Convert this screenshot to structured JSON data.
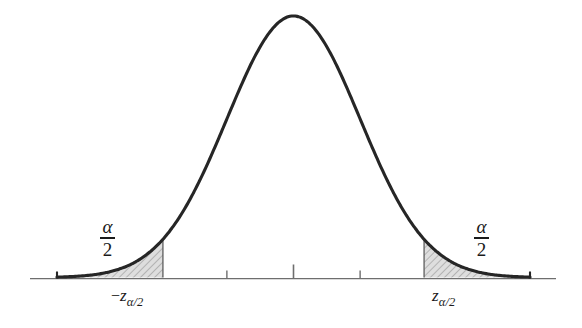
{
  "figure": {
    "background_color": "#ffffff",
    "curve_color": "#262626",
    "axis_color": "#6e6e6e",
    "shade_fill_color": "#d4d4d4",
    "shade_hatch_color": "#8c8c8c"
  },
  "labels": {
    "alpha_symbol": "α",
    "denominator": "2",
    "left_tail_area": "α/2",
    "right_tail_area": "α/2",
    "minus_sign": "−",
    "z_symbol": "z",
    "z_subscript": "α/2",
    "left_critical_value": "−zα/2",
    "right_critical_value": "zα/2"
  },
  "chart_data": {
    "type": "line",
    "title": "",
    "subtitle": "",
    "xlabel": "",
    "ylabel": "",
    "grid": false,
    "legend": null,
    "distribution": "standard normal (Gaussian)",
    "mean": 0,
    "sigma": 1,
    "xlim": [
      -3.55,
      3.55
    ],
    "ylim": [
      0,
      0.42
    ],
    "axis_tick_positions": [
      -1,
      0,
      1
    ],
    "axis_tick_labels": [
      "",
      "",
      ""
    ],
    "center_tick_is_tall": true,
    "annotations": [
      {
        "name": "left-critical-value",
        "text": "−zα/2",
        "x": -1.96,
        "y": 0
      },
      {
        "name": "right-critical-value",
        "text": "zα/2",
        "x": 1.96,
        "y": 0
      },
      {
        "name": "left-tail-area-label",
        "text": "α/2",
        "x": -2.5,
        "y": 0.085
      },
      {
        "name": "right-tail-area-label",
        "text": "α/2",
        "x": 2.5,
        "y": 0.085
      }
    ],
    "shaded_regions": [
      {
        "name": "left-tail",
        "from": -3.55,
        "to": -1.96,
        "area_label": "α/2",
        "fill": "#d4d4d4"
      },
      {
        "name": "right-tail",
        "from": 1.96,
        "to": 3.55,
        "area_label": "α/2",
        "fill": "#d4d4d4"
      }
    ],
    "x": [
      -3.55,
      -3.4,
      -3.2,
      -3.0,
      -2.8,
      -2.6,
      -2.4,
      -2.2,
      -2.0,
      -1.8,
      -1.6,
      -1.4,
      -1.2,
      -1.0,
      -0.8,
      -0.6,
      -0.4,
      -0.2,
      0.0,
      0.2,
      0.4,
      0.6,
      0.8,
      1.0,
      1.2,
      1.4,
      1.6,
      1.8,
      2.0,
      2.2,
      2.4,
      2.6,
      2.8,
      3.0,
      3.2,
      3.4,
      3.55
    ],
    "y": [
      0.0007,
      0.0012,
      0.0024,
      0.0044,
      0.0079,
      0.0136,
      0.0224,
      0.0355,
      0.054,
      0.079,
      0.1109,
      0.1497,
      0.1942,
      0.242,
      0.2897,
      0.3332,
      0.3683,
      0.391,
      0.3989,
      0.391,
      0.3683,
      0.3332,
      0.2897,
      0.242,
      0.1942,
      0.1497,
      0.1109,
      0.079,
      0.054,
      0.0355,
      0.0224,
      0.0136,
      0.0079,
      0.0044,
      0.0024,
      0.0012,
      0.0007
    ]
  }
}
